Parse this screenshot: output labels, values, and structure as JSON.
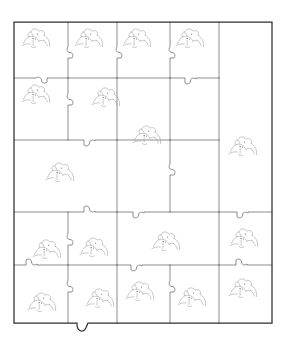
{
  "figure": {
    "type": "jigsaw-puzzle-diagram",
    "background_color": "#ffffff",
    "border_color": "#2e2e2e",
    "piece_line_color": "#5d5d5d",
    "motif_color": "#9a9a9a",
    "canvas": {
      "width": 283,
      "height": 350
    }
  },
  "board": {
    "outline": {
      "x": 14,
      "y": 22,
      "width": 258,
      "height": 301
    },
    "bottom_tab": {
      "x": 78,
      "y": 323,
      "note": "tab protrudes below bottom edge"
    },
    "column_lines": [
      14,
      68,
      117,
      170,
      219,
      272
    ],
    "row_lines": [
      22,
      78,
      140,
      212,
      265,
      323
    ],
    "piece_count": 18
  },
  "pieces": [
    {
      "id": "p1",
      "row": 1,
      "col": 1,
      "motif": true,
      "motif_x": 32,
      "motif_y": 32
    },
    {
      "id": "p2",
      "row": 1,
      "col": 2,
      "motif": true,
      "motif_x": 85,
      "motif_y": 32
    },
    {
      "id": "p3",
      "row": 1,
      "col": 3,
      "motif": true,
      "motif_x": 133,
      "motif_y": 32
    },
    {
      "id": "p4",
      "row": 1,
      "col": 4,
      "motif": true,
      "motif_x": 186,
      "motif_y": 32
    },
    {
      "id": "p5",
      "row": 2,
      "col": 1,
      "motif": true,
      "motif_x": 32,
      "motif_y": 90
    },
    {
      "id": "p6",
      "row": 2,
      "col": 2,
      "motif": true,
      "motif_x": 104,
      "motif_y": 93
    },
    {
      "id": "p7",
      "row": 2,
      "col": 3,
      "motif": true,
      "motif_x": 147,
      "motif_y": 132
    },
    {
      "id": "p8",
      "row": 2,
      "col": 4,
      "motif": false,
      "motif_x": 0,
      "motif_y": 0
    },
    {
      "id": "p9",
      "row": 2,
      "col": 5,
      "motif": true,
      "motif_x": 242,
      "motif_y": 143
    },
    {
      "id": "p10",
      "row": 3,
      "col": 1,
      "motif": true,
      "motif_x": 58,
      "motif_y": 170
    },
    {
      "id": "p11",
      "row": 4,
      "col": 1,
      "motif": true,
      "motif_x": 45,
      "motif_y": 247
    },
    {
      "id": "p12",
      "row": 4,
      "col": 2,
      "motif": true,
      "motif_x": 92,
      "motif_y": 245
    },
    {
      "id": "p13",
      "row": 4,
      "col": 3,
      "motif": true,
      "motif_x": 165,
      "motif_y": 240
    },
    {
      "id": "p14",
      "row": 4,
      "col": 4,
      "motif": true,
      "motif_x": 243,
      "motif_y": 238
    },
    {
      "id": "p15",
      "row": 5,
      "col": 1,
      "motif": true,
      "motif_x": 40,
      "motif_y": 300
    },
    {
      "id": "p16",
      "row": 5,
      "col": 2,
      "motif": true,
      "motif_x": 98,
      "motif_y": 296
    },
    {
      "id": "p17",
      "row": 5,
      "col": 3,
      "motif": true,
      "motif_x": 138,
      "motif_y": 289
    },
    {
      "id": "p18",
      "row": 5,
      "col": 4,
      "motif": true,
      "motif_x": 190,
      "motif_y": 295
    },
    {
      "id": "p19",
      "row": 5,
      "col": 5,
      "motif": true,
      "motif_x": 241,
      "motif_y": 288
    }
  ],
  "motif": {
    "name": "bird-head-sketch",
    "description": "small hand-drawn grey line sketch of a crested bird head repeated on each puzzle piece"
  }
}
